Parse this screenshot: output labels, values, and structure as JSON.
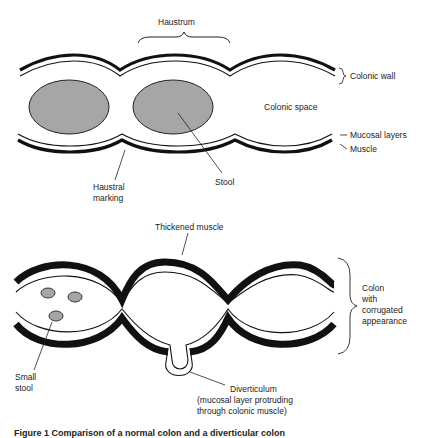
{
  "figure": {
    "top_panel": {
      "name": "normal-colon",
      "labels": {
        "haustrum": "Haustrum",
        "colonic_wall": "Colonic wall",
        "colonic_space": "Colonic space",
        "mucosal_layers": "Mucosal layers",
        "muscle": "Muscle",
        "haustral_marking_line1": "Haustral",
        "haustral_marking_line2": "marking",
        "stool": "Stool"
      },
      "colors": {
        "stool_fill": "#a6a6a6",
        "wall": "#111111"
      }
    },
    "bottom_panel": {
      "name": "diverticular-colon",
      "labels": {
        "thickened_muscle": "Thickened muscle",
        "colon_line1": "Colon",
        "colon_line2": "with",
        "colon_line3": "corrugated",
        "colon_line4": "appearance",
        "small_stool_line1": "Small",
        "small_stool_line2": "stool",
        "diverticulum_line1": "Diverticulum",
        "diverticulum_line2": "(mucosal layer protruding",
        "diverticulum_line3": "through colonic muscle)"
      },
      "colors": {
        "stool_fill": "#a6a6a6",
        "muscle": "#111111"
      }
    },
    "caption": "Figure 1  Comparison of a normal colon and a diverticular colon"
  }
}
